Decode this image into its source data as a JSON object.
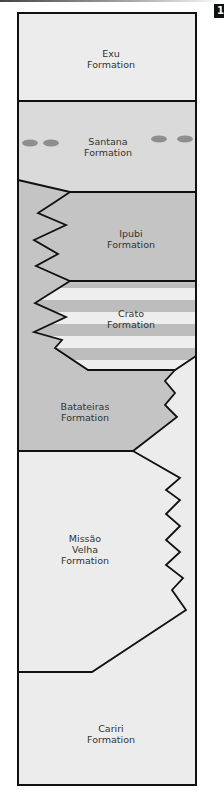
{
  "figure": {
    "badge": "1"
  },
  "colors": {
    "light_fill": "#ececec",
    "medium_fill": "#dadada",
    "dark_fill": "#c4c4c4",
    "stripe_light": "#eeeeee",
    "stripe_dark": "#bdbdbd",
    "nodule": "#8e8e8e",
    "line": "#111111"
  },
  "formations": [
    {
      "name": "Exu\nFormation",
      "fill": "light"
    },
    {
      "name": "Santana\nFormation",
      "fill": "medium",
      "feature": "nodules"
    },
    {
      "name": "Ipubi\nFormation",
      "fill": "dark"
    },
    {
      "name": "Crato\nFormation",
      "fill": "striped"
    },
    {
      "name": "Batateiras\nFormation",
      "fill": "dark"
    },
    {
      "name": "Missão\nVelha\nFormation",
      "fill": "light"
    },
    {
      "name": "Cariri\nFormation",
      "fill": "light"
    }
  ]
}
